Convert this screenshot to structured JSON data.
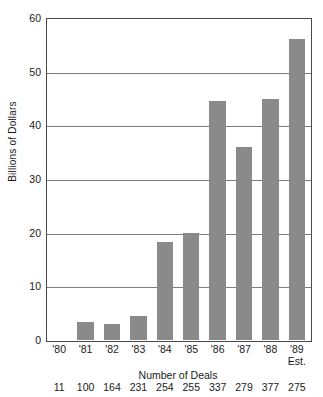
{
  "chart_data": {
    "type": "bar",
    "title": "",
    "xlabel": "",
    "ylabel": "Billions of Dollars",
    "ylim": [
      0,
      60
    ],
    "yticks": [
      0,
      10,
      20,
      30,
      40,
      50,
      60
    ],
    "grid": true,
    "legend": null,
    "bar_color": "#8a8a8a",
    "categories": [
      "'80",
      "'81",
      "'82",
      "'83",
      "'84",
      "'85",
      "'86",
      "'87",
      "'88",
      "'89"
    ],
    "category_sublabels": [
      "",
      "",
      "",
      "",
      "",
      "",
      "",
      "",
      "",
      "Est."
    ],
    "values": [
      0,
      3.4,
      3.0,
      4.5,
      18.2,
      20.0,
      44.5,
      36.0,
      45.0,
      56.0
    ],
    "secondary_axis": {
      "label": "Number of Deals",
      "values": [
        11,
        100,
        164,
        231,
        254,
        255,
        337,
        279,
        377,
        275
      ]
    }
  },
  "axes": {
    "y_tick_labels": [
      "60",
      "50",
      "40",
      "30",
      "20",
      "10",
      "0"
    ],
    "y_title": "Billions of Dollars"
  },
  "deals": {
    "title": "Number of Deals",
    "values": [
      "11",
      "100",
      "164",
      "231",
      "254",
      "255",
      "337",
      "279",
      "377",
      "275"
    ]
  },
  "xlabels": [
    {
      "year": "'80",
      "sub": ""
    },
    {
      "year": "'81",
      "sub": ""
    },
    {
      "year": "'82",
      "sub": ""
    },
    {
      "year": "'83",
      "sub": ""
    },
    {
      "year": "'84",
      "sub": ""
    },
    {
      "year": "'85",
      "sub": ""
    },
    {
      "year": "'86",
      "sub": ""
    },
    {
      "year": "'87",
      "sub": ""
    },
    {
      "year": "'88",
      "sub": ""
    },
    {
      "year": "'89",
      "sub": "Est."
    }
  ]
}
